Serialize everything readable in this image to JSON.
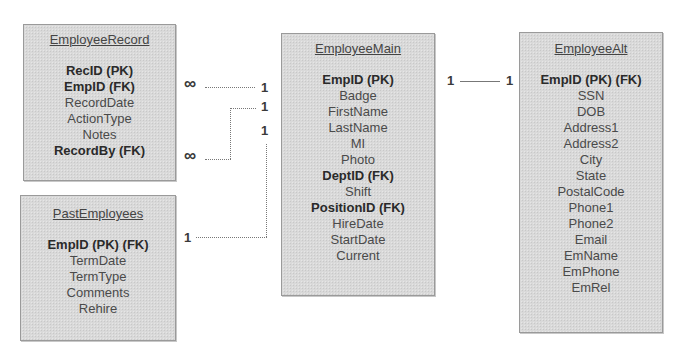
{
  "entities": {
    "employee_record": {
      "title": "EmployeeRecord",
      "fields": [
        {
          "label": "RecID (PK)",
          "key": true
        },
        {
          "label": "EmpID (FK)",
          "key": true
        },
        {
          "label": "RecordDate",
          "key": false
        },
        {
          "label": "ActionType",
          "key": false
        },
        {
          "label": "Notes",
          "key": false
        },
        {
          "label": "RecordBy (FK)",
          "key": true
        }
      ]
    },
    "past_employees": {
      "title": "PastEmployees",
      "fields": [
        {
          "label": "EmpID (PK) (FK)",
          "key": true
        },
        {
          "label": "TermDate",
          "key": false
        },
        {
          "label": "TermType",
          "key": false
        },
        {
          "label": "Comments",
          "key": false
        },
        {
          "label": "Rehire",
          "key": false
        }
      ]
    },
    "employee_main": {
      "title": "EmployeeMain",
      "fields": [
        {
          "label": "EmpID (PK)",
          "key": true
        },
        {
          "label": "Badge",
          "key": false
        },
        {
          "label": "FirstName",
          "key": false
        },
        {
          "label": "LastName",
          "key": false
        },
        {
          "label": "MI",
          "key": false
        },
        {
          "label": "Photo",
          "key": false
        },
        {
          "label": "DeptID (FK)",
          "key": true
        },
        {
          "label": "Shift",
          "key": false
        },
        {
          "label": "PositionID (FK)",
          "key": true
        },
        {
          "label": "HireDate",
          "key": false
        },
        {
          "label": "StartDate",
          "key": false
        },
        {
          "label": "Current",
          "key": false
        }
      ]
    },
    "employee_alt": {
      "title": "EmployeeAlt",
      "fields": [
        {
          "label": "EmpID (PK) (FK)",
          "key": true
        },
        {
          "label": "SSN",
          "key": false
        },
        {
          "label": "DOB",
          "key": false
        },
        {
          "label": "Address1",
          "key": false
        },
        {
          "label": "Address2",
          "key": false
        },
        {
          "label": "City",
          "key": false
        },
        {
          "label": "State",
          "key": false
        },
        {
          "label": "PostalCode",
          "key": false
        },
        {
          "label": "Phone1",
          "key": false
        },
        {
          "label": "Phone2",
          "key": false
        },
        {
          "label": "Email",
          "key": false
        },
        {
          "label": "EmName",
          "key": false
        },
        {
          "label": "EmPhone",
          "key": false
        },
        {
          "label": "EmRel",
          "key": false
        }
      ]
    }
  },
  "relationships": [
    {
      "from": "EmployeeRecord.EmpID",
      "to": "EmployeeMain.EmpID",
      "from_card": "∞",
      "to_card": "1"
    },
    {
      "from": "EmployeeRecord.RecordBy",
      "to": "EmployeeMain.EmpID",
      "from_card": "∞",
      "to_card": "1"
    },
    {
      "from": "PastEmployees.EmpID",
      "to": "EmployeeMain.EmpID",
      "from_card": "1",
      "to_card": "1"
    },
    {
      "from": "EmployeeMain.EmpID",
      "to": "EmployeeAlt.EmpID",
      "from_card": "1",
      "to_card": "1"
    }
  ],
  "colors": {
    "box_fill": "#d9d9d9",
    "box_border": "#9a9a9a",
    "text": "#3a3a3a",
    "connector": "#777777"
  }
}
